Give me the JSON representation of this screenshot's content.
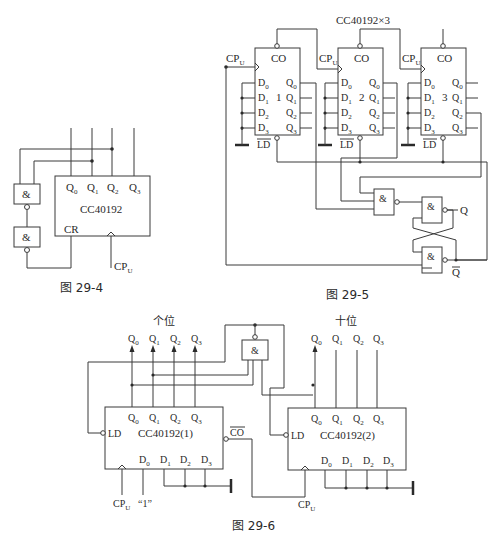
{
  "figures": {
    "fig4": {
      "caption": "图 29-4",
      "chip": "CC40192",
      "outputs": [
        "Q0",
        "Q1",
        "Q2",
        "Q3"
      ],
      "pins": {
        "cr": "CR",
        "clock": "CPU"
      },
      "gates": [
        "&",
        "&"
      ]
    },
    "fig5": {
      "caption": "图 29-5",
      "title": "CC40192×3",
      "chips": [
        {
          "index": "1",
          "co": "CO",
          "ld": "LD",
          "inputs": [
            "D0",
            "D1",
            "D2",
            "D3"
          ],
          "outputs": [
            "Q0",
            "Q1",
            "Q2",
            "Q3"
          ],
          "clock": "CPU"
        },
        {
          "index": "2",
          "co": "CO",
          "ld": "LD",
          "inputs": [
            "D0",
            "D1",
            "D2",
            "D3"
          ],
          "outputs": [
            "Q0",
            "Q1",
            "Q2",
            "Q3"
          ],
          "clock": "CPU"
        },
        {
          "index": "3",
          "co": "CO",
          "ld": "LD",
          "inputs": [
            "D0",
            "D1",
            "D2",
            "D3"
          ],
          "outputs": [
            "Q0",
            "Q1",
            "Q2",
            "Q3"
          ],
          "clock": "CPU"
        }
      ],
      "gates": [
        "&",
        "&",
        "&"
      ],
      "latch_outputs": {
        "q": "Q",
        "qbar": "Q"
      }
    },
    "fig6": {
      "caption": "图 29-6",
      "ones_label": "个位",
      "tens_label": "十位",
      "chip1": {
        "name": "CC40192(1)",
        "ld": "LD",
        "co": "CO",
        "inputs": [
          "D0",
          "D1",
          "D2",
          "D3"
        ],
        "outputs": [
          "Q0",
          "Q1",
          "Q2",
          "Q3"
        ],
        "clock": "CPU",
        "d0_value": "“1”"
      },
      "chip2": {
        "name": "CC40192(2)",
        "ld": "LD",
        "inputs": [
          "D0",
          "D1",
          "D2",
          "D3"
        ],
        "outputs": [
          "Q0",
          "Q1",
          "Q2",
          "Q3"
        ],
        "clock": "CPU"
      },
      "gate": "&"
    }
  }
}
